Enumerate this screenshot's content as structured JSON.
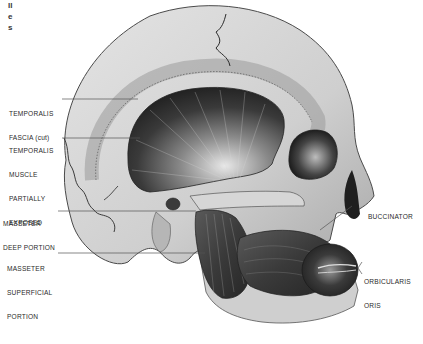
{
  "illustration": {
    "subject": "Lateral view of human skull showing muscles of mastication and facial expression",
    "top_fragment_text": [
      "ll",
      "e",
      "s"
    ],
    "labels": [
      {
        "id": "temporalis-fascia",
        "lines": [
          "TEMPORALIS",
          "FASCIA (cut)"
        ]
      },
      {
        "id": "temporalis-muscle",
        "lines": [
          "TEMPORALIS",
          "MUSCLE",
          "PARTIALLY",
          "EXPOSED"
        ]
      },
      {
        "id": "masseter-deep",
        "lines": [
          "MASSETER",
          "DEEP PORTION"
        ]
      },
      {
        "id": "masseter-superficial",
        "lines": [
          "MASSETER",
          "SUPERFICIAL",
          "PORTION"
        ]
      },
      {
        "id": "buccinator",
        "lines": [
          "BUCCINATOR"
        ]
      },
      {
        "id": "orbicularis-oris",
        "lines": [
          "ORBICULARIS",
          "ORIS"
        ]
      }
    ],
    "colors": {
      "background": "#ffffff",
      "bone": "#c9c9c9",
      "bone_light": "#dedede",
      "muscle_dark": "#2e2e2e",
      "muscle_mid": "#6a6a6a",
      "leader_line": "#555555",
      "text": "#2a2a2a"
    }
  }
}
